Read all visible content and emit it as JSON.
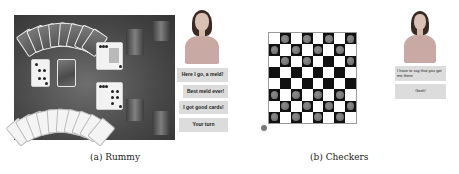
{
  "rummy": {
    "caption": "(a) Rummy",
    "agent_buttons": [
      {
        "label": "Here I go, a meld!"
      },
      {
        "label": "Best meld ever!"
      },
      {
        "label": "I got good cards!"
      },
      {
        "label": "Your turn"
      }
    ],
    "table": {
      "opponent_hand_cards": 8,
      "player_hand_cards": 10,
      "discard_pile_top": "4 of clubs",
      "melds": [
        "queen of clubs meld",
        "spades meld"
      ]
    }
  },
  "checkers": {
    "caption": "(b) Checkers",
    "agent_messages": [
      {
        "label": "I have to say that you got me there"
      },
      {
        "label": "Gosh!"
      }
    ],
    "board": {
      "size": 8,
      "pieces": [
        "0,1",
        "0,3",
        "0,5",
        "0,7",
        "1,0",
        "1,2",
        "1,4",
        "1,6",
        "2,1",
        "2,3",
        "2,7",
        "5,0",
        "5,2",
        "5,4",
        "5,6",
        "6,1",
        "6,3",
        "6,5",
        "6,7",
        "7,0",
        "7,2",
        "7,4",
        "7,6"
      ]
    }
  },
  "colors": {
    "table": "#4a4a4a",
    "button_bg": "#dcdcdc",
    "dark_square": "#111111",
    "piece": "#777777"
  }
}
